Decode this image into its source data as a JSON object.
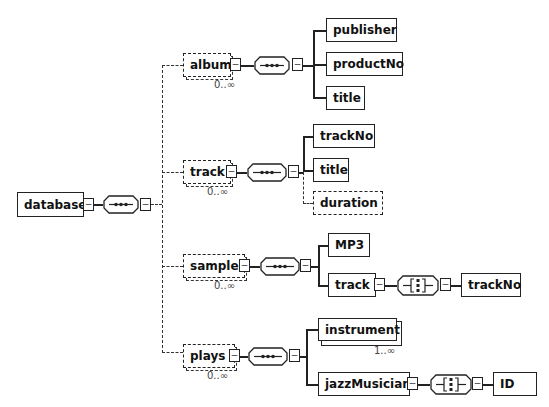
{
  "root": {
    "name": "database",
    "compositor": "sequence"
  },
  "children": [
    {
      "name": "album",
      "optional": true,
      "cardinality": "0..∞",
      "compositor": "sequence",
      "children": [
        {
          "name": "publisher",
          "optional": false
        },
        {
          "name": "productNo",
          "optional": false
        },
        {
          "name": "title",
          "optional": false
        }
      ]
    },
    {
      "name": "track",
      "optional": true,
      "cardinality": "0..∞",
      "compositor": "sequence",
      "children": [
        {
          "name": "trackNo",
          "optional": false
        },
        {
          "name": "title",
          "optional": false
        },
        {
          "name": "duration",
          "optional": true
        }
      ]
    },
    {
      "name": "sample",
      "optional": true,
      "cardinality": "0..∞",
      "compositor": "sequence",
      "children": [
        {
          "name": "MP3",
          "optional": false
        },
        {
          "name": "track",
          "optional": false,
          "compositor": "choice",
          "children": [
            {
              "name": "trackNo"
            }
          ]
        }
      ]
    },
    {
      "name": "plays",
      "optional": true,
      "cardinality": "0..∞",
      "compositor": "sequence",
      "children": [
        {
          "name": "instrument",
          "optional": false,
          "cardinality": "1..∞"
        },
        {
          "name": "jazzMusician",
          "optional": false,
          "compositor": "choice",
          "children": [
            {
              "name": "ID"
            }
          ]
        }
      ]
    }
  ],
  "icons": {
    "collapse": "−"
  }
}
